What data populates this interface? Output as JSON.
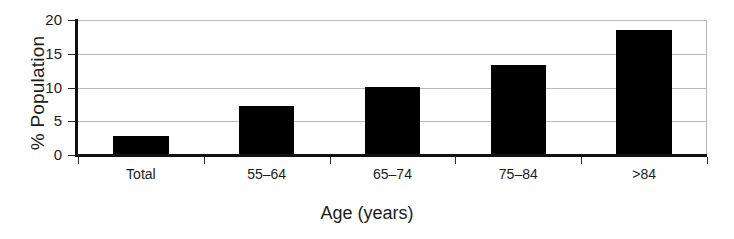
{
  "chart_data": {
    "type": "bar",
    "title": "",
    "xlabel": "Age (years)",
    "ylabel": "% Population",
    "categories": [
      "Total",
      "55–64",
      "65–74",
      "75–84",
      ">84"
    ],
    "values": [
      2.8,
      7.2,
      10.1,
      13.4,
      18.5
    ],
    "ylim": [
      0,
      20
    ],
    "yticks": [
      0,
      5,
      10,
      15,
      20
    ],
    "ytick_labels": [
      "0",
      "5",
      "10",
      "15",
      "20"
    ],
    "grid": "horizontal",
    "legend": "none",
    "bar_color": "#000000",
    "gridline_color": "#b9b9b9",
    "axis_color": "#111111",
    "background_color": "#ffffff"
  }
}
